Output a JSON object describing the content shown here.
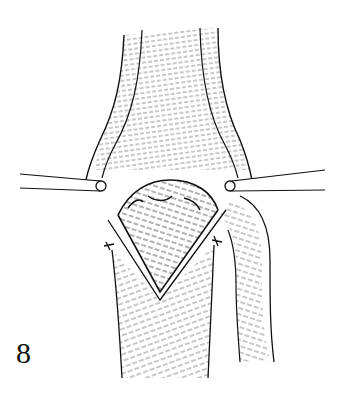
{
  "figure": {
    "number": "8",
    "colors": {
      "ink": "#111111",
      "background": "#ffffff"
    }
  }
}
